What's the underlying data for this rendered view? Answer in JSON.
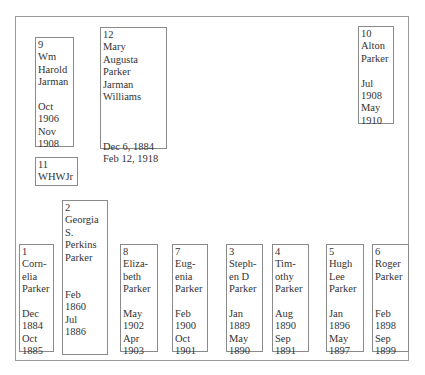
{
  "diagram": {
    "boxes": {
      "b9": {
        "lines": [
          "9",
          "Wm",
          "Harold",
          "Jarman",
          "",
          "Oct",
          "1906",
          "Nov",
          "1908"
        ]
      },
      "b12": {
        "lines": [
          "12",
          "Mary",
          "Augusta",
          "Parker",
          "Jarman",
          "Williams",
          "",
          "",
          "",
          "Dec  6, 1884",
          "Feb 12, 1918"
        ]
      },
      "b11": {
        "lines": [
          "11",
          "WHWJr"
        ]
      },
      "b10": {
        "lines": [
          "10",
          "Alton",
          "Parker",
          "",
          "Jul",
          "1908",
          "May",
          "1910"
        ]
      },
      "b2": {
        "lines": [
          "2",
          "Georgia",
          "S.",
          "Perkins",
          "Parker",
          "",
          "",
          "Feb",
          "1860",
          "Jul",
          "1886"
        ]
      },
      "b1": {
        "lines": [
          "1",
          "Corn-",
          "elia",
          "Parker",
          "",
          "Dec",
          "1884",
          "Oct",
          "1885"
        ]
      },
      "b8": {
        "lines": [
          "8",
          "Eliza-",
          "beth",
          "Parker",
          "",
          "May",
          "1902",
          "Apr",
          "1903"
        ]
      },
      "b7": {
        "lines": [
          "7",
          "Eug-",
          "enia",
          "Parker",
          "",
          "Feb",
          "1900",
          "Oct",
          "1901"
        ]
      },
      "b3": {
        "lines": [
          "3",
          "Steph-",
          "en D",
          "Parker",
          "",
          "Jan",
          "1889",
          "May",
          "1890"
        ]
      },
      "b4": {
        "lines": [
          "4",
          "Tim-",
          "othy",
          "Parker",
          "",
          "Aug",
          "1890",
          "Sep",
          "1891"
        ]
      },
      "b5": {
        "lines": [
          "5",
          "Hugh",
          "Lee",
          "Parker",
          "",
          "Jan",
          "1896",
          "May",
          "1897"
        ]
      },
      "b6": {
        "lines": [
          "6",
          "Roger",
          "Parker",
          "",
          "",
          "Feb",
          "1898",
          "Sep",
          "1899"
        ]
      }
    }
  }
}
